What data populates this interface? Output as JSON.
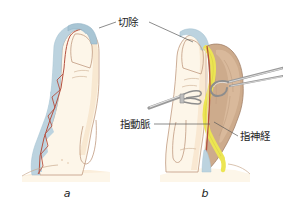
{
  "figure": {
    "background_color": "#ffffff",
    "width": 283,
    "height": 214,
    "panels": [
      {
        "id": "a",
        "letter": "a",
        "letter_x": 67,
        "letter_y": 197,
        "description": "Lateral view of fingertip with shaded region marked for resection"
      },
      {
        "id": "b",
        "letter": "b",
        "letter_x": 205,
        "letter_y": 197,
        "description": "Flap elevated showing digital nerve and digital artery with instruments"
      }
    ],
    "annotations": [
      {
        "id": "resection",
        "label": "切除",
        "text_x": 118,
        "text_y": 26,
        "anchor": "start",
        "leaders": [
          {
            "points": "116,22 99,28"
          },
          {
            "points": "148,22 193,42"
          }
        ]
      },
      {
        "id": "digital-artery",
        "label": "指動脈",
        "text_x": 120,
        "text_y": 128,
        "anchor": "start",
        "leaders": [
          {
            "points": "153,124 213,124"
          }
        ]
      },
      {
        "id": "digital-nerve",
        "label": "指神経",
        "text_x": 240,
        "text_y": 140,
        "anchor": "start",
        "leaders": [
          {
            "points": "238,136 214,124"
          }
        ]
      }
    ],
    "colors": {
      "skin": "#fbeedb",
      "skin_light": "#fdf6e9",
      "skin_shadow": "#f6e3c8",
      "resection_blue": "#bcd3df",
      "resection_blue_dark": "#a8c5d4",
      "flap_tan": "#cdab8c",
      "flap_tan_light": "#dabb9d",
      "nerve_yellow": "#ece553",
      "artery_red": "#b5503f",
      "outline": "#b08a72",
      "outline_dark": "#8a6b56",
      "instrument_gray": "#8d8d8d",
      "instrument_light": "#dcdcdc",
      "leader_line": "#5a5a5a",
      "text": "#1d1d1d"
    }
  }
}
